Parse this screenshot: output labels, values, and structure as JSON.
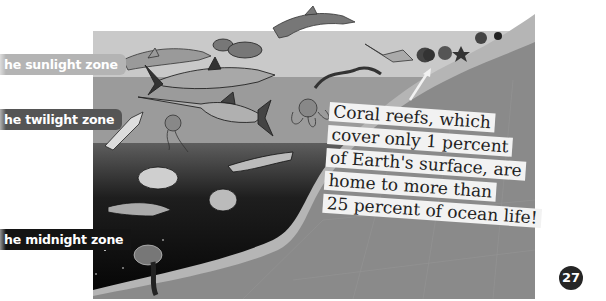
{
  "zones": [
    {
      "label": "he sunlight zone",
      "color": "#b4b4b4"
    },
    {
      "label": "he twilight zone",
      "color": "#555555"
    },
    {
      "label": "he midnight zone",
      "color": "#141414"
    }
  ],
  "caption": {
    "lines": [
      "Coral reefs, which",
      "cover only 1 percent",
      "of Earth's surface, are",
      "home to more than",
      "25 percent of ocean life!"
    ]
  },
  "page_number": "27",
  "colors": {
    "sunlight_water": "#c8c8c8",
    "twilight_water": "#9a9a9a",
    "deep_water_top": "#5a5a5a",
    "deep_water_bottom": "#050505",
    "land": "#8a8a8a",
    "land_rim": "#b5b5b5"
  },
  "illustration": {
    "creatures": [
      "dolphin",
      "shark",
      "hammerhead-shark",
      "fish-school",
      "swordfish",
      "squid",
      "jellyfish",
      "octopus",
      "eel",
      "manta-ray",
      "deep-sea-fish",
      "anglerfish",
      "hatchetfish",
      "coral",
      "starfish"
    ]
  }
}
